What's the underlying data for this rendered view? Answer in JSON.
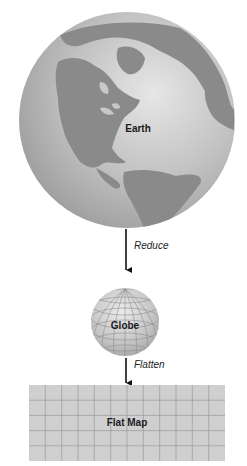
{
  "diagram": {
    "nodes": [
      {
        "id": "earth",
        "label": "Earth",
        "shape": "sphere-with-continents"
      },
      {
        "id": "globe",
        "label": "Globe",
        "shape": "sphere-with-graticule"
      },
      {
        "id": "flat_map",
        "label": "Flat Map",
        "shape": "rectangle-grid",
        "grid": {
          "columns": 12,
          "rows": 5
        }
      }
    ],
    "edges": [
      {
        "from": "earth",
        "to": "globe",
        "label": "Reduce"
      },
      {
        "from": "globe",
        "to": "flat_map",
        "label": "Flatten"
      }
    ]
  },
  "colors": {
    "ocean": "#c4c4c4",
    "land": "#8a8a8a",
    "globe": "#c8c8c8",
    "grid_line": "#9a9a9a",
    "map_fill": "#cfcfcf",
    "arrow": "#111111"
  }
}
